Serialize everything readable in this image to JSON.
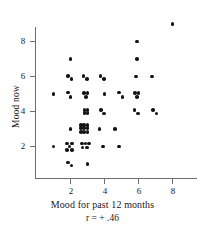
{
  "chart_data": {
    "type": "scatter",
    "title": "",
    "xlabel": "Mood for past 12 months",
    "ylabel": "Mood now",
    "annotation": "r = + .46",
    "xlim": [
      0.3,
      8.8
    ],
    "ylim": [
      0.4,
      9.4
    ],
    "xticks": [
      2,
      4,
      6,
      8
    ],
    "yticks": [
      2,
      4,
      6,
      8
    ],
    "xtick_labels": [
      "2",
      "4",
      "6",
      "8"
    ],
    "ytick_labels": [
      "2",
      "4",
      "6",
      "8"
    ],
    "grid": false,
    "legend": null,
    "marker": "filled-circle",
    "marker_color": "#141414",
    "axis_color": "#6e6e6e",
    "points": [
      [
        8.0,
        9.0
      ],
      [
        5.9,
        8.0
      ],
      [
        2.0,
        7.0
      ],
      [
        5.9,
        7.0
      ],
      [
        1.85,
        6.05
      ],
      [
        2.05,
        5.85
      ],
      [
        2.75,
        6.05
      ],
      [
        2.95,
        5.85
      ],
      [
        3.75,
        6.05
      ],
      [
        3.95,
        5.85
      ],
      [
        5.85,
        6.0
      ],
      [
        6.8,
        6.0
      ],
      [
        1.0,
        5.0
      ],
      [
        1.85,
        5.1
      ],
      [
        2.0,
        4.85
      ],
      [
        2.8,
        5.05
      ],
      [
        3.0,
        5.05
      ],
      [
        2.9,
        4.82
      ],
      [
        4.0,
        5.0
      ],
      [
        4.85,
        5.08
      ],
      [
        5.05,
        4.85
      ],
      [
        5.8,
        5.05
      ],
      [
        6.0,
        5.05
      ],
      [
        5.9,
        4.82
      ],
      [
        2.82,
        4.1
      ],
      [
        3.0,
        4.1
      ],
      [
        2.82,
        3.92
      ],
      [
        3.0,
        3.92
      ],
      [
        3.8,
        4.1
      ],
      [
        3.98,
        3.9
      ],
      [
        5.75,
        4.1
      ],
      [
        5.95,
        3.9
      ],
      [
        6.85,
        4.1
      ],
      [
        7.05,
        3.9
      ],
      [
        2.0,
        3.0
      ],
      [
        2.6,
        3.25
      ],
      [
        2.8,
        3.25
      ],
      [
        3.0,
        3.25
      ],
      [
        2.6,
        3.05
      ],
      [
        2.8,
        3.05
      ],
      [
        3.0,
        3.05
      ],
      [
        2.6,
        2.85
      ],
      [
        2.8,
        2.85
      ],
      [
        3.0,
        2.85
      ],
      [
        3.7,
        3.0
      ],
      [
        4.6,
        3.0
      ],
      [
        1.0,
        2.0
      ],
      [
        1.78,
        2.18
      ],
      [
        2.08,
        2.18
      ],
      [
        1.93,
        2.0
      ],
      [
        1.78,
        1.82
      ],
      [
        2.08,
        1.82
      ],
      [
        2.68,
        2.18
      ],
      [
        2.88,
        2.18
      ],
      [
        3.08,
        2.18
      ],
      [
        2.7,
        1.95
      ],
      [
        2.95,
        1.95
      ],
      [
        3.9,
        2.0
      ],
      [
        4.85,
        2.0
      ],
      [
        1.85,
        1.1
      ],
      [
        2.05,
        0.92
      ],
      [
        3.0,
        1.0
      ]
    ]
  }
}
